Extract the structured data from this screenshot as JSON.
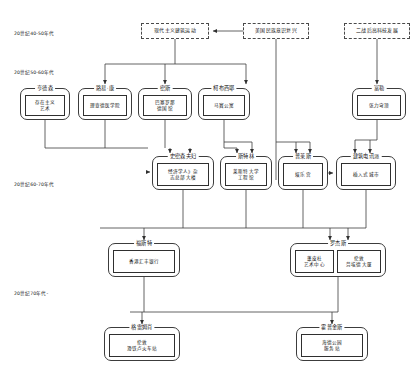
{
  "diagram": {
    "type": "flowchart",
    "orientation": "top-to-bottom",
    "colors": {
      "line": "#3c3c3c",
      "box_border": "#2f2f2f",
      "dashed_border": "#4a4a4a",
      "background": "#ffffff",
      "text": "#111111"
    },
    "era_labels": [
      {
        "id": "era-40-50",
        "text": "20世纪40-50年代",
        "x": 14,
        "y": 30
      },
      {
        "id": "era-50-60",
        "text": "20世纪50-60年代",
        "x": 14,
        "y": 69
      },
      {
        "id": "era-60-70",
        "text": "20世纪60-70年代",
        "x": 14,
        "y": 181
      },
      {
        "id": "era-70",
        "text": "20世纪70年代-",
        "x": 14,
        "y": 290
      }
    ],
    "influences": [
      {
        "id": "influence-modernism",
        "label": "现代主义建筑运动",
        "x": 141,
        "y": 23,
        "w": 68,
        "h": 16
      },
      {
        "id": "influence-national-revival",
        "label": "美国民族意识复兴",
        "x": 243,
        "y": 23,
        "w": 66,
        "h": 16
      },
      {
        "id": "influence-postwar-tech",
        "label": "二战后高科技发展",
        "x": 344,
        "y": 23,
        "w": 66,
        "h": 16
      }
    ],
    "nodes": [
      {
        "id": "node-henderson",
        "name": "亨德森",
        "works": [
          "存在主义\n艺术"
        ],
        "x": 20,
        "y": 88,
        "w": 50,
        "h": 32
      },
      {
        "id": "node-louis-kahn",
        "name": "路易·康",
        "works": [
          "理查德医学院"
        ],
        "x": 78,
        "y": 88,
        "w": 54,
        "h": 32
      },
      {
        "id": "node-mies",
        "name": "密斯",
        "works": [
          "巴塞罗那\n德国馆"
        ],
        "x": 138,
        "y": 88,
        "w": 54,
        "h": 32
      },
      {
        "id": "node-corbusier",
        "name": "柯布西耶",
        "works": [
          "马赛公寓"
        ],
        "x": 198,
        "y": 88,
        "w": 52,
        "h": 32
      },
      {
        "id": "node-fuller",
        "name": "富勒",
        "works": [
          "张力穹顶"
        ],
        "x": 352,
        "y": 88,
        "w": 54,
        "h": 32
      },
      {
        "id": "node-smithsons",
        "name": "史密森夫妇",
        "works": [
          "经济学人》杂\n志总部大楼"
        ],
        "x": 152,
        "y": 156,
        "w": 62,
        "h": 34
      },
      {
        "id": "node-stirling",
        "name": "斯特林",
        "works": [
          "莱斯特大学\n工程馆"
        ],
        "x": 220,
        "y": 156,
        "w": 52,
        "h": 34
      },
      {
        "id": "node-price",
        "name": "普莱斯",
        "works": [
          "娱乐宫"
        ],
        "x": 278,
        "y": 156,
        "w": 50,
        "h": 34
      },
      {
        "id": "node-archigram",
        "name": "建筑电讯派",
        "works": [
          "插入式城市"
        ],
        "x": 336,
        "y": 156,
        "w": 60,
        "h": 34
      },
      {
        "id": "node-foster",
        "name": "福斯特",
        "works": [
          "香港汇丰银行"
        ],
        "x": 108,
        "y": 243,
        "w": 72,
        "h": 34
      },
      {
        "id": "node-rogers",
        "name": "罗杰斯",
        "works": [
          "蓬皮杜\n艺术中心",
          "伦敦\n劳埃德大厦"
        ],
        "x": 290,
        "y": 243,
        "w": 96,
        "h": 34
      },
      {
        "id": "node-grimshaw",
        "name": "格雷姆肖",
        "works": [
          "伦敦\n滑铁卢火车站"
        ],
        "x": 104,
        "y": 327,
        "w": 76,
        "h": 34
      },
      {
        "id": "node-hopkins",
        "name": "霍普金斯",
        "works": [
          "海德公园\n服务站"
        ],
        "x": 296,
        "y": 327,
        "w": 72,
        "h": 34
      }
    ],
    "edges": [
      {
        "from": "influence-national-revival",
        "to": "influence-modernism"
      },
      {
        "from": "influence-modernism",
        "to": "node-louis-kahn"
      },
      {
        "from": "influence-modernism",
        "to": "node-mies"
      },
      {
        "from": "influence-modernism",
        "to": "node-corbusier"
      },
      {
        "from": "influence-postwar-tech",
        "to": "node-fuller"
      },
      {
        "from": "node-henderson",
        "to": "node-smithsons"
      },
      {
        "from": "node-louis-kahn",
        "to": "node-smithsons"
      },
      {
        "from": "node-mies",
        "to": "node-smithsons"
      },
      {
        "from": "node-mies",
        "to": "node-stirling"
      },
      {
        "from": "node-corbusier",
        "to": "node-stirling"
      },
      {
        "from": "node-corbusier",
        "to": "node-price"
      },
      {
        "from": "influence-national-revival",
        "to": "node-price"
      },
      {
        "from": "node-fuller",
        "to": "node-archigram"
      },
      {
        "from": "node-price",
        "to": "node-archigram"
      },
      {
        "from": "node-smithsons",
        "to": "node-foster"
      },
      {
        "from": "node-stirling",
        "to": "node-foster"
      },
      {
        "from": "node-archigram",
        "to": "node-rogers"
      },
      {
        "from": "node-price",
        "to": "node-rogers"
      },
      {
        "from": "node-foster",
        "to": "node-grimshaw"
      },
      {
        "from": "node-foster",
        "to": "node-hopkins"
      },
      {
        "from": "node-rogers",
        "to": "node-hopkins"
      }
    ]
  }
}
